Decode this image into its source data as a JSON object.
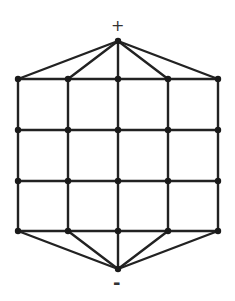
{
  "diagram": {
    "top_label": "+",
    "bottom_label": "-",
    "colors": {
      "edge": "#222222",
      "node": "#1a1a1a",
      "background": "#ffffff"
    },
    "grid": {
      "columns_x": [
        18,
        68,
        118,
        168,
        218
      ],
      "rows_y": [
        79,
        130,
        181,
        231
      ]
    },
    "top_apex": {
      "x": 118,
      "y": 41
    },
    "bottom_apex": {
      "x": 118,
      "y": 269
    }
  }
}
